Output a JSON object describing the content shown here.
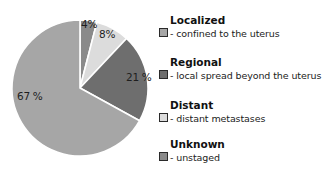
{
  "chart_data": {
    "type": "pie",
    "title": "",
    "categories": [
      "Unknown",
      "Distant",
      "Regional",
      "Localized"
    ],
    "values": [
      4,
      8,
      21,
      67
    ],
    "unit": "%",
    "start_angle": "12 o'clock",
    "direction": "clockwise",
    "series": [
      {
        "name": "Unknown",
        "description": "- unstaged",
        "value": 4,
        "label": "4%",
        "color": "#8a8a8a"
      },
      {
        "name": "Distant",
        "description": "- distant metastases",
        "value": 8,
        "label": "8%",
        "color": "#dcdcdc"
      },
      {
        "name": "Regional",
        "description": "- local spread beyond the uterus",
        "value": 21,
        "label": "21 %",
        "color": "#6e6e6e"
      },
      {
        "name": "Localized",
        "description": "- confined to the uterus",
        "value": 67,
        "label": "67 %",
        "color": "#a6a6a6"
      }
    ],
    "legend_position": "right",
    "legend": [
      {
        "title": "Localized",
        "description": "- confined to the uterus",
        "color": "#a6a6a6"
      },
      {
        "title": "Regional",
        "description": "- local spread beyond the uterus",
        "color": "#6e6e6e"
      },
      {
        "title": "Distant",
        "description": "- distant metastases",
        "color": "#dcdcdc"
      },
      {
        "title": "Unknown",
        "description": "- unstaged",
        "color": "#8a8a8a"
      }
    ]
  }
}
